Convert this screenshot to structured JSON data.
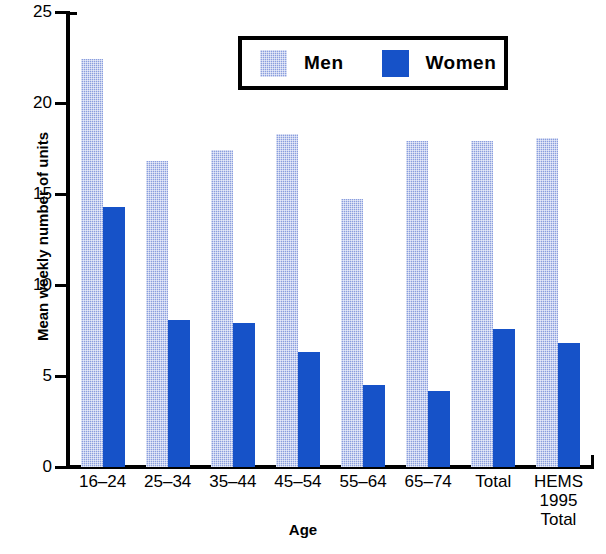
{
  "chart_data": {
    "type": "bar",
    "title": "",
    "xlabel": "Age",
    "ylabel": "Mean weekly number of units",
    "categories": [
      "16–24",
      "25–34",
      "35–44",
      "45–54",
      "55–64",
      "65–74",
      "Total",
      "HEMS\n1995\nTotal"
    ],
    "series": [
      {
        "name": "Men",
        "color": "#8a9ede",
        "values": [
          22.4,
          16.8,
          17.4,
          18.3,
          14.7,
          17.9,
          17.9,
          18.1
        ]
      },
      {
        "name": "Women",
        "color": "#1652c8",
        "values": [
          14.3,
          8.1,
          7.9,
          6.3,
          4.5,
          4.2,
          7.6,
          6.8
        ]
      }
    ],
    "ylim": [
      0,
      25
    ],
    "yticks": [
      0,
      5,
      10,
      15,
      20,
      25
    ],
    "ytick_labels": [
      "0",
      "5",
      "10",
      "15",
      "20",
      "25"
    ],
    "grid": false,
    "legend_position": "top-center"
  },
  "legend": {
    "entries": [
      {
        "label": "Men"
      },
      {
        "label": "Women"
      }
    ]
  },
  "axes": {
    "y_title": "Mean weekly number of units",
    "x_title": "Age"
  }
}
